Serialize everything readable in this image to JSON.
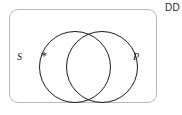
{
  "figure": {
    "corner_label": "DD",
    "frame": {
      "name": "universe-rectangle"
    },
    "sets": [
      {
        "id": "S",
        "label": "S",
        "label_position": "outside-left"
      },
      {
        "id": "P",
        "label": "P",
        "label_position": "inside-right"
      }
    ],
    "marks": [
      {
        "id": "existential-mark",
        "glyph": "*",
        "region": "S-only"
      }
    ],
    "diagram_type": "venn-two-set-overlapping"
  }
}
